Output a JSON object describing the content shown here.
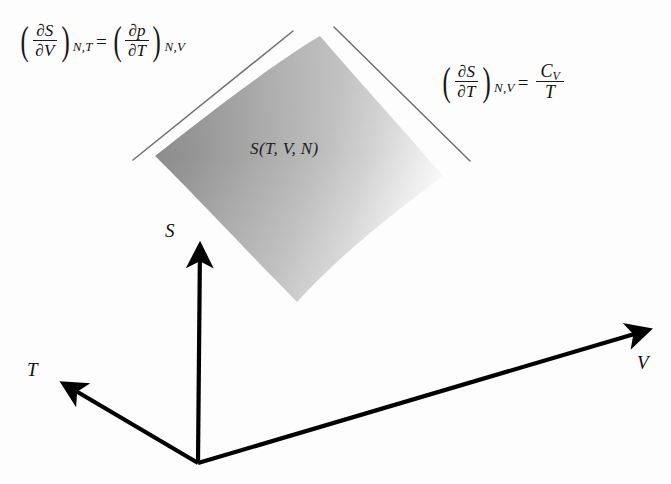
{
  "diagram": {
    "background_color": "#fdfdfd",
    "axis_color": "#000000",
    "tangent_line_color": "#6e6e6e",
    "surface": {
      "label": "S(T, V, N)",
      "gradient_dark": "#8e8e8e",
      "gradient_mid": "#b9b9b9",
      "gradient_light": "#fbfbfb"
    }
  },
  "equations": {
    "left": {
      "lhs": {
        "numerator": "∂S",
        "denominator": "∂V",
        "subscript": "N,T"
      },
      "equals": "=",
      "rhs": {
        "numerator": "∂p",
        "denominator": "∂T",
        "subscript": "N,V"
      },
      "plain": "(∂S/∂V)N,T = (∂p/∂T)N,V"
    },
    "right": {
      "lhs": {
        "numerator": "∂S",
        "denominator": "∂T",
        "subscript": "N,V"
      },
      "equals": "=",
      "rhs": {
        "numerator": "C",
        "numerator_subscript": "V",
        "denominator": "T"
      },
      "plain": "(∂S/∂T)N,V = CV/T"
    },
    "paren_open": "(",
    "paren_close": ")"
  },
  "axes": {
    "entropy": {
      "label": "S",
      "direction": "up"
    },
    "temperature": {
      "label": "T",
      "direction": "down-left"
    },
    "volume": {
      "label": "V",
      "direction": "down-right"
    },
    "origin": {
      "x": 198,
      "y": 463
    }
  }
}
